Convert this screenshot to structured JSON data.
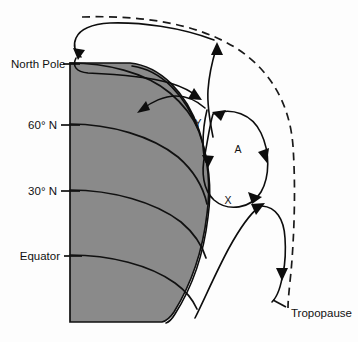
{
  "figure": {
    "kind": "atmospheric-circulation-diagram",
    "background_color": "#fdfdfd",
    "earth_fill_color": "#8a8a8a",
    "line_color": "#111111"
  },
  "labels": {
    "north_pole": "North Pole",
    "lat_60n": "60° N",
    "lat_30n": "30° N",
    "equator": "Equator",
    "tropopause": "Tropopause"
  },
  "cell_markers": {
    "polar_front_y": "Y",
    "ferrel_cell_a": "A",
    "subtropical_x": "X"
  }
}
